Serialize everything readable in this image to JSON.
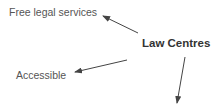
{
  "diagram": {
    "center": {
      "label": "Law Centres"
    },
    "nodes": [
      {
        "label": "Free legal services"
      },
      {
        "label": "Accessible"
      },
      {
        "label": ""
      }
    ],
    "colors": {
      "arrow": "#444444",
      "text": "#555555",
      "center_text": "#333333"
    }
  }
}
